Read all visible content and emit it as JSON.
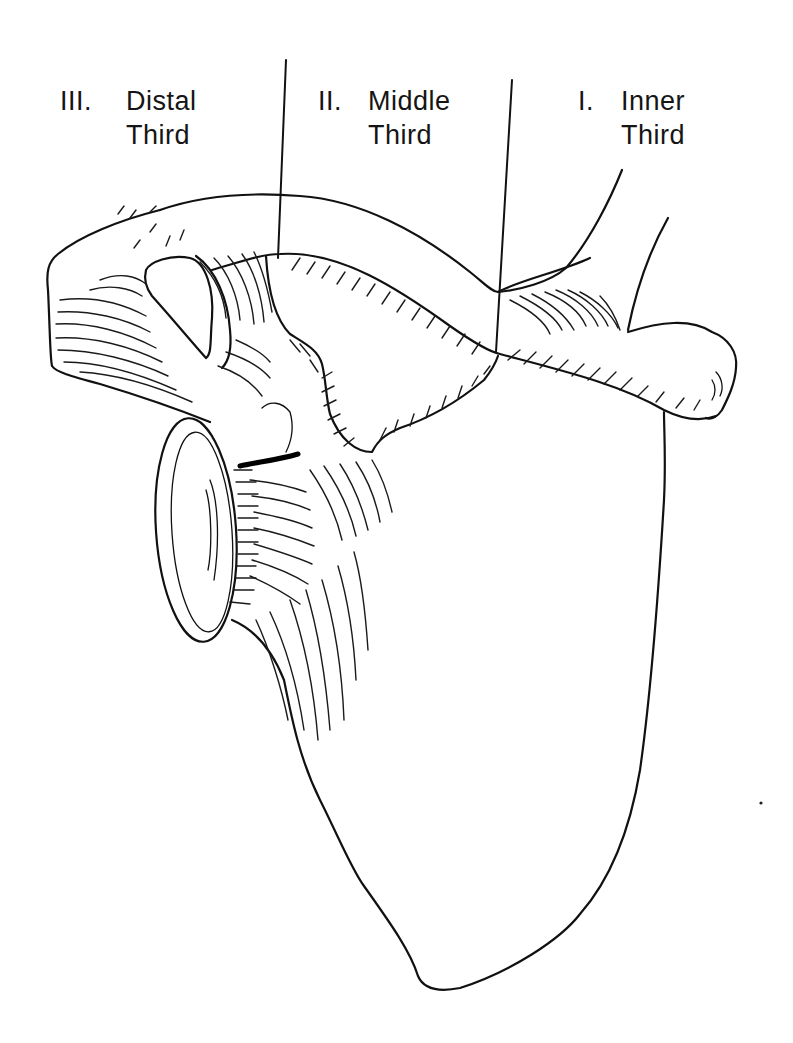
{
  "figure": {
    "colors": {
      "ink": "#111111",
      "background": "#ffffff"
    }
  },
  "labels": [
    {
      "numeral": "III.",
      "line1": "Distal",
      "line2": "Third"
    },
    {
      "numeral": "II.",
      "line1": "Middle",
      "line2": "Third"
    },
    {
      "numeral": "I.",
      "line1": "Inner",
      "line2": "Third"
    }
  ]
}
